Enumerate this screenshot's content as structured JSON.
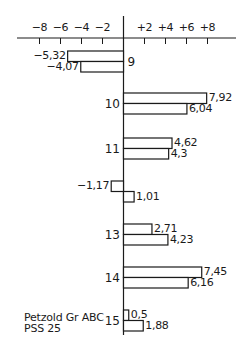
{
  "chart_data": {
    "type": "bar",
    "orientation": "horizontal",
    "title": "",
    "xlabel": "",
    "ylabel": "",
    "xlim": [
      -10,
      10.5
    ],
    "x_ticks": [
      {
        "value": -8,
        "label": "−8"
      },
      {
        "value": -6,
        "label": "−6"
      },
      {
        "value": -4,
        "label": "−4"
      },
      {
        "value": -2,
        "label": "−2"
      },
      {
        "value": 2,
        "label": "+2"
      },
      {
        "value": 4,
        "label": "+4"
      },
      {
        "value": 6,
        "label": "+6"
      },
      {
        "value": 8,
        "label": "+8"
      }
    ],
    "grid": false,
    "categories": [
      "9",
      "10",
      "11",
      "12",
      "13",
      "14",
      "15"
    ],
    "category_labels_visible": [
      "9",
      "10",
      "11",
      "",
      "13",
      "14",
      "15"
    ],
    "series": [
      {
        "name": "Petzold Gr ABC",
        "values": [
          -5.32,
          7.92,
          4.62,
          -1.17,
          2.71,
          7.45,
          0.5
        ],
        "labels": [
          "−5,32",
          "7,92",
          "4,62",
          "−1,17",
          "2,71",
          "7,45",
          "0,5"
        ]
      },
      {
        "name": "PSS 25",
        "values": [
          -4.07,
          6.04,
          4.3,
          1.01,
          4.23,
          6.16,
          1.88
        ],
        "labels": [
          "−4,07",
          "6,04",
          "4,3",
          "1,01",
          "4,23",
          "6,16",
          "1,88"
        ]
      }
    ],
    "legend": {
      "position": "bottom-left",
      "entries": [
        "Petzold Gr ABC",
        "PSS 25"
      ]
    },
    "colors": {
      "bar_fill": "#ffffff",
      "bar_stroke": "#1a1a1a",
      "axis": "#1a1a1a"
    }
  },
  "legend": {
    "line1": "Petzold Gr ABC",
    "line2": "PSS 25"
  }
}
